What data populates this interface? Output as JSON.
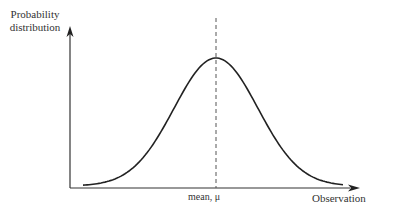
{
  "chart_data": {
    "type": "line",
    "title": "",
    "xlabel": "Observation",
    "ylabel": "Probability distribution",
    "ylabel_lines": [
      "Probability",
      "distribution"
    ],
    "annotations": [
      {
        "text": "mean, μ",
        "position": "x-axis at peak",
        "style": "dashed vertical line"
      }
    ],
    "curve": "normal (bell-shaped) distribution, symmetric about the mean",
    "x": [
      -3,
      -2.5,
      -2,
      -1.5,
      -1,
      -0.5,
      0,
      0.5,
      1,
      1.5,
      2,
      2.5,
      3
    ],
    "values": [
      0.004,
      0.018,
      0.054,
      0.13,
      0.242,
      0.352,
      0.399,
      0.352,
      0.242,
      0.13,
      0.054,
      0.018,
      0.004
    ],
    "grid": false,
    "ticks": false,
    "legend": null
  },
  "labels": {
    "y_line1": "Probability",
    "y_line2": "distribution",
    "x": "Observation",
    "mean": "mean, μ"
  },
  "colors": {
    "curve": "#222222",
    "axis": "#333333",
    "dashed": "#555555"
  }
}
